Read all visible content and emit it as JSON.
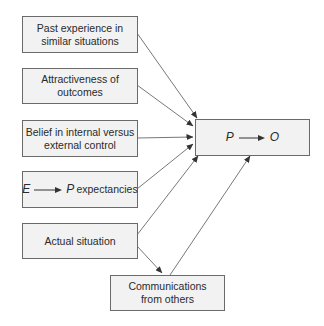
{
  "diagram": {
    "inputs": [
      {
        "id": "past-experience",
        "label": "Past experience in similar situations"
      },
      {
        "id": "attractiveness",
        "label": "Attractiveness of outcomes"
      },
      {
        "id": "belief-control",
        "label": "Belief in internal versus external control"
      },
      {
        "id": "ep-expectancies",
        "label_left": "E",
        "label_right": "P",
        "label_suffix": "expectancies"
      },
      {
        "id": "actual-situation",
        "label": "Actual situation"
      }
    ],
    "target": {
      "id": "p-to-o",
      "left": "P",
      "right": "O"
    },
    "communications": {
      "id": "communications",
      "label": "Communications from others"
    },
    "edges": [
      {
        "from": "past-experience",
        "to": "p-to-o"
      },
      {
        "from": "attractiveness",
        "to": "p-to-o"
      },
      {
        "from": "belief-control",
        "to": "p-to-o"
      },
      {
        "from": "ep-expectancies",
        "to": "p-to-o"
      },
      {
        "from": "actual-situation",
        "to": "p-to-o"
      },
      {
        "from": "actual-situation",
        "to": "communications"
      },
      {
        "from": "communications",
        "to": "p-to-o"
      }
    ],
    "colors": {
      "box_fill": "#f2f2f2",
      "box_border": "#6a6a6a",
      "line": "#444444",
      "text": "#2a2a2a"
    }
  }
}
